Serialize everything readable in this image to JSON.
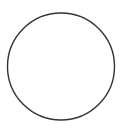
{
  "diagram": {
    "shape": "circle",
    "center": {
      "x": 61,
      "y": 66.5
    },
    "radius": 53.5,
    "stroke_color": "#333333",
    "stroke_width": 1.4,
    "fill": "#ffffff",
    "background": "#ffffff"
  }
}
